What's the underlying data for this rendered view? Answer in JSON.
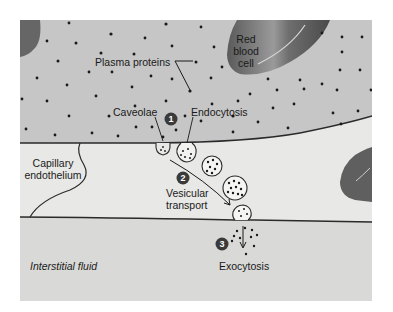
{
  "figure": {
    "regions": {
      "capillary_lumen": {
        "color": "#c9c9c9"
      },
      "endothelium": {
        "color": "#e6e6e4"
      },
      "interstitial": {
        "color": "#d9d9d7"
      }
    },
    "labels": {
      "plasma_proteins": "Plasma proteins",
      "red_blood_cell_line1": "Red",
      "red_blood_cell_line2": "blood",
      "red_blood_cell_line3": "cell",
      "caveolae": "Caveolae",
      "endocytosis": "Endocytosis",
      "capillary_endothelium_line1": "Capillary",
      "capillary_endothelium_line2": "endothelium",
      "vesicular_transport_line1": "Vesicular",
      "vesicular_transport_line2": "transport",
      "exocytosis": "Exocytosis",
      "interstitial_fluid": "Interstitial fluid"
    },
    "steps": [
      {
        "number": "1"
      },
      {
        "number": "2"
      },
      {
        "number": "3"
      }
    ]
  }
}
